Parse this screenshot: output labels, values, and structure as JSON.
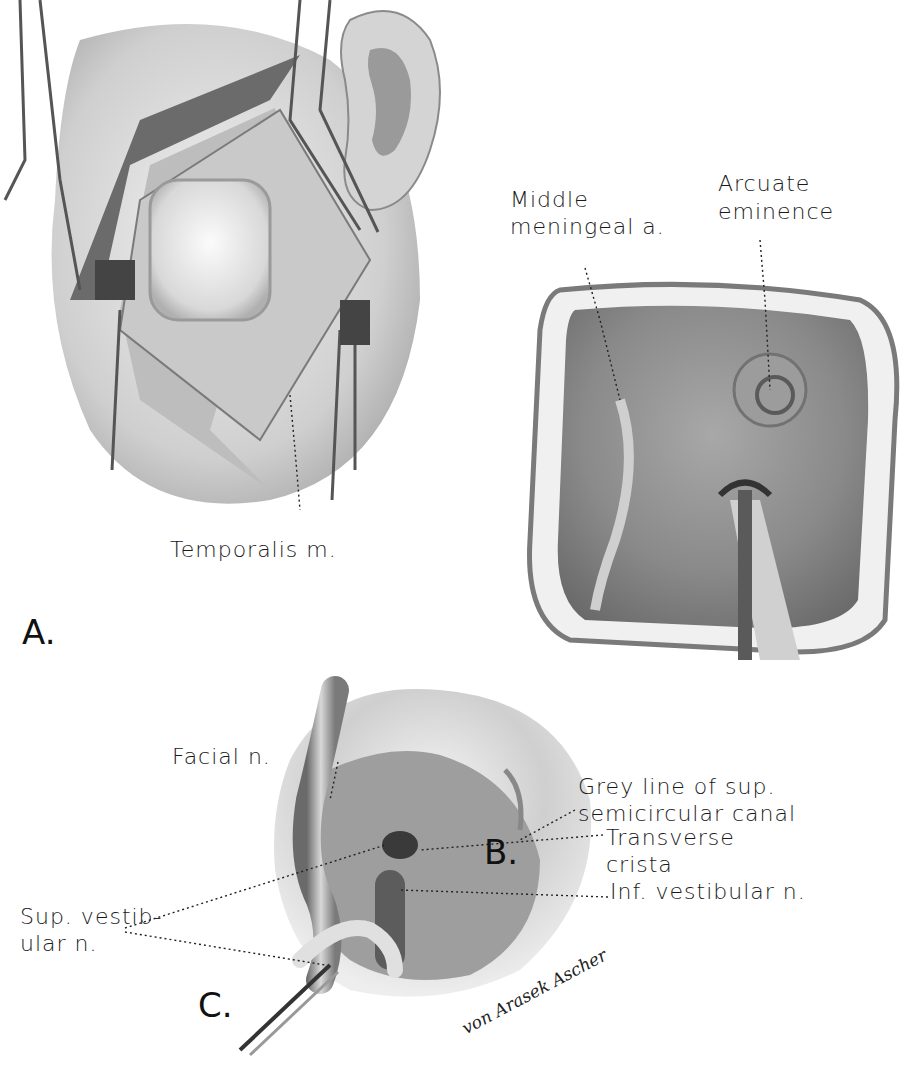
{
  "figures": {
    "a": {
      "letter": "A.",
      "labels": {
        "temporalis": "Temporalis m."
      }
    },
    "b": {
      "letter": "B.",
      "labels": {
        "middle_meningeal_line1": "Middle",
        "middle_meningeal_line2": "meningeal a.",
        "arcuate_line1": "Arcuate",
        "arcuate_line2": "eminence"
      }
    },
    "c": {
      "letter": "C.",
      "labels": {
        "facial": "Facial n.",
        "grey_line1": "Grey line of sup.",
        "grey_line2": "semicircular canal",
        "transverse_line1": "Transverse",
        "transverse_line2": "crista",
        "inf_vestibular": "Inf. vestibular n.",
        "sup_vestibular_line1": "Sup. vestib-",
        "sup_vestibular_line2": "ular n."
      }
    }
  },
  "signature": "von Arasek Ascher",
  "colors": {
    "ink": "#1a1a1a",
    "tissue_light": "#e6e6e6",
    "tissue_mid": "#b5b5b5",
    "tissue_dark": "#5a5a5a",
    "background": "#ffffff"
  }
}
